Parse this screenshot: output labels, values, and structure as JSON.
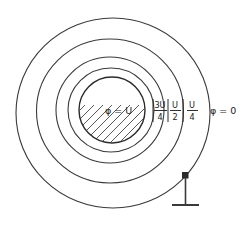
{
  "figure": {
    "type": "electrostatics-equipotential-diagram",
    "background_color": "#ffffff",
    "line_color": "#3a3a3a"
  },
  "core": {
    "label": "φ = U",
    "fill_pattern": "diagonal-hatch",
    "description": "hatched conductor cross-section"
  },
  "equipotentials": [
    {
      "id": "inner-ring",
      "label_numerator": "3U",
      "label_denominator": "4",
      "label_plain": "3U/4"
    },
    {
      "id": "mid-ring",
      "label_numerator": "U",
      "label_denominator": "2",
      "label_plain": "U/2"
    },
    {
      "id": "outer-ring",
      "label_numerator": "U",
      "label_denominator": "4",
      "label_plain": "U/4"
    }
  ],
  "outer": {
    "label": "φ = 0"
  },
  "ground": {
    "symbol": "earth-ground",
    "node": "connection-point"
  }
}
